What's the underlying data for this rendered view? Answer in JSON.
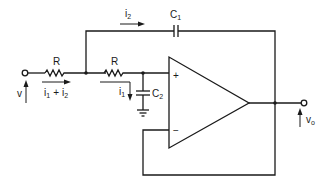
{
  "diagram": {
    "type": "circuit-schematic",
    "components": {
      "R1": {
        "label": "R"
      },
      "R2": {
        "label": "R"
      },
      "C1": {
        "label": "C",
        "sub": "1"
      },
      "C2": {
        "label": "C",
        "sub": "2"
      },
      "opamp": {
        "plus": "+",
        "minus": "−"
      }
    },
    "currents": {
      "i2": {
        "label": "i",
        "sub": "2"
      },
      "i1": {
        "label": "i",
        "sub": "1"
      },
      "sum": {
        "a": "i",
        "a_sub": "1",
        "op": "+",
        "b": "i",
        "b_sub": "2"
      }
    },
    "voltages": {
      "input": {
        "label": "v"
      },
      "output": {
        "label": "v",
        "sub": "o"
      }
    },
    "colors": {
      "ink": "#1a1a1a",
      "background": "#ffffff"
    }
  }
}
